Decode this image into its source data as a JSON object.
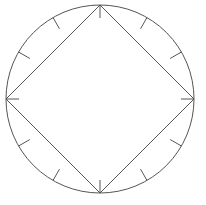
{
  "figure": {
    "background_color": "#ffffff",
    "stroke_color": "#555555",
    "stroke_width": 1,
    "canvas": {
      "width": 206,
      "height": 205
    }
  },
  "circle": {
    "label": "circumscribed circle",
    "center_x": 100,
    "center_y": 99,
    "radius": 94
  },
  "square": {
    "label": "inscribed square",
    "rotation_degrees": 45,
    "vertex_count": 4,
    "vertices": [
      {
        "name": "top-vertex",
        "angle_degrees": 270,
        "x": 100,
        "y": 5
      },
      {
        "name": "right-vertex",
        "angle_degrees": 0,
        "x": 194,
        "y": 99
      },
      {
        "name": "bottom-vertex",
        "angle_degrees": 90,
        "x": 100,
        "y": 193
      },
      {
        "name": "left-vertex",
        "angle_degrees": 180,
        "x": 6,
        "y": 99
      }
    ]
  },
  "ticks": {
    "label": "radial tick marks on circle",
    "count": 12,
    "spacing_degrees": 30,
    "length": 13,
    "direction": "inward",
    "angles_degrees": [
      0,
      30,
      60,
      90,
      120,
      150,
      180,
      210,
      240,
      270,
      300,
      330
    ],
    "at_vertices_degrees": [
      0,
      90,
      180,
      270
    ],
    "on_arcs_degrees": [
      30,
      60,
      120,
      150,
      210,
      240,
      300,
      330
    ]
  }
}
